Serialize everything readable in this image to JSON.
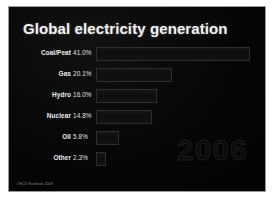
{
  "slide": {
    "title": "Global electricity generation",
    "watermark": "2006",
    "footer": "OECD Factbook 2008",
    "background_color": "#050505",
    "title_color": "#f4f4f4",
    "border_color": "#9a9a9a",
    "bar_fill_color": "#101010",
    "bar_border_color": "#2e2e2e"
  },
  "chart_data": {
    "type": "bar",
    "title": "Global electricity generation",
    "xlabel": "",
    "ylabel": "",
    "orientation": "horizontal",
    "grid": false,
    "legend": "none",
    "xlim": [
      0,
      45
    ],
    "unit": "%",
    "categories": [
      "Coal/Peat",
      "Gas",
      "Hydro",
      "Nuclear",
      "Oil",
      "Other"
    ],
    "values": [
      41.0,
      20.1,
      16.0,
      14.8,
      5.8,
      2.3
    ],
    "value_labels": [
      "41.0%",
      "20.1%",
      "16.0%",
      "14.8%",
      "5.8%",
      "2.3%"
    ],
    "annotations": [
      "2006"
    ],
    "rows": [
      {
        "category": "Coal/Peat",
        "value": 41.0,
        "label": "41.0%",
        "bar_px": 154
      },
      {
        "category": "Gas",
        "value": 20.1,
        "label": "20.1%",
        "bar_px": 76
      },
      {
        "category": "Hydro",
        "value": 16.0,
        "label": "16.0%",
        "bar_px": 61
      },
      {
        "category": "Nuclear",
        "value": 14.8,
        "label": "14.8%",
        "bar_px": 56
      },
      {
        "category": "Oil",
        "value": 5.8,
        "label": "5.8%",
        "bar_px": 23
      },
      {
        "category": "Other",
        "value": 2.3,
        "label": "2.3%",
        "bar_px": 10
      }
    ]
  }
}
